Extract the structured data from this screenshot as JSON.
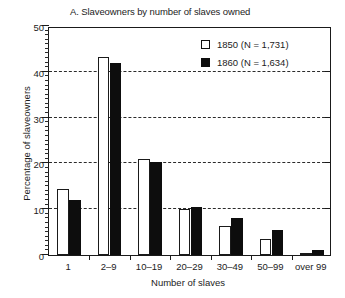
{
  "chart_data": {
    "type": "bar",
    "title": "A. Slaveowners by number of slaves owned",
    "xlabel": "Number of slaves",
    "ylabel": "Percentage of slaveowners",
    "categories": [
      "1",
      "2–9",
      "10–19",
      "20–29",
      "30–49",
      "50–99",
      "over 99"
    ],
    "series": [
      {
        "name": "1850 (N = 1,731)",
        "values": [
          14.5,
          43.3,
          21.0,
          10.0,
          6.3,
          3.5,
          0.5
        ]
      },
      {
        "name": "1860 (N = 1,634)",
        "values": [
          12.0,
          42.0,
          20.3,
          10.5,
          8.0,
          5.5,
          1.0
        ]
      }
    ],
    "ylim": [
      0,
      50
    ],
    "y_ticks": [
      0,
      10,
      20,
      30,
      40,
      50
    ],
    "y_tick_labels": [
      "0",
      "10",
      "20",
      "30",
      "40",
      "50"
    ],
    "y_minor_tick_step": 1,
    "grid": "horizontal-dashed",
    "legend_position": "top-right-inside"
  },
  "legend": {
    "entries": [
      {
        "label": "1850 (N = 1,731)",
        "swatch": "open-square",
        "color": "#ffffff"
      },
      {
        "label": "1860 (N = 1,634)",
        "swatch": "filled-square",
        "color": "#0d0d0d"
      }
    ]
  },
  "colors": {
    "series_1850": "#ffffff",
    "series_1860": "#0d0d0d",
    "axis": "#1a1a1a",
    "grid": "#2b2b2b",
    "background": "#ffffff"
  }
}
